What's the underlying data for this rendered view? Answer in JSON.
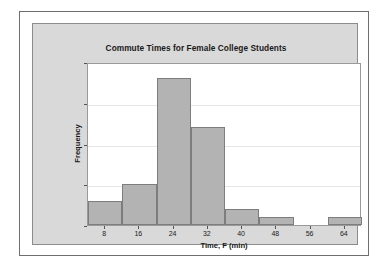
{
  "chart_data": {
    "type": "bar",
    "title": "Commute Times for Female College Students",
    "xlabel": "Time, F (min)",
    "ylabel": "Frequency",
    "categories": [
      "8",
      "16",
      "24",
      "32",
      "40",
      "48",
      "56",
      "64"
    ],
    "values": [
      3,
      5,
      18,
      12,
      2,
      1,
      0,
      1
    ],
    "bin_width": 8,
    "bin_edges": [
      4,
      12,
      20,
      28,
      36,
      44,
      52,
      60,
      68
    ],
    "xlim": [
      4,
      68
    ],
    "ylim": [
      0,
      20
    ],
    "x_ticks": [
      "8",
      "16",
      "24",
      "32",
      "40",
      "48",
      "56",
      "64"
    ],
    "y_ticks": [
      "0",
      "5",
      "10",
      "15",
      "20"
    ],
    "y_tick_values": [
      0,
      5,
      10,
      15,
      20
    ],
    "grid": true,
    "grid_axis": "y",
    "legend": null,
    "bar_fill_color": "#b3b3b3",
    "bar_edge_color": "#7d7d7d",
    "plot_background_color": "#ffffff",
    "panel_background_color": "#d9d9d9",
    "gridline_color": "#e6e6e6"
  }
}
